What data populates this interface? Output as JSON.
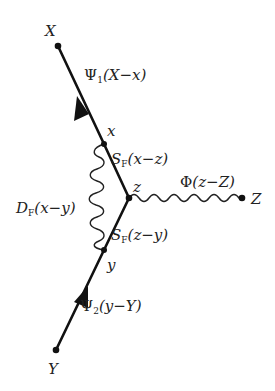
{
  "diagram": {
    "type": "feynman-diagram",
    "colors": {
      "line": "#111111",
      "text": "#222222",
      "background": "#ffffff"
    },
    "points": {
      "X": {
        "label": "X",
        "kind": "external"
      },
      "Y": {
        "label": "Y",
        "kind": "external"
      },
      "Z": {
        "label": "Z",
        "kind": "external"
      },
      "x": {
        "label": "x",
        "kind": "vertex"
      },
      "y": {
        "label": "y",
        "kind": "vertex"
      },
      "z": {
        "label": "z",
        "kind": "vertex"
      }
    },
    "lines": {
      "psi1": {
        "symbol": "Ψ",
        "sub": "1",
        "arg": "(X−x)",
        "style": "fermion-arrow",
        "from": "x",
        "to": "X"
      },
      "sf_xz": {
        "symbol": "S",
        "sub": "F",
        "arg": "(x−z)",
        "style": "fermion",
        "from": "z",
        "to": "x"
      },
      "sf_zy": {
        "symbol": "S",
        "sub": "F",
        "arg": "(z−y)",
        "style": "fermion",
        "from": "y",
        "to": "z"
      },
      "psi2": {
        "symbol": "Ψ",
        "sub": "2",
        "arg": "(y−Y)",
        "style": "fermion-arrow",
        "from": "Y",
        "to": "y"
      },
      "df": {
        "symbol": "D",
        "sub": "F",
        "arg": "(x−y)",
        "style": "photon-wavy",
        "from": "x",
        "to": "y"
      },
      "phi": {
        "symbol": "Φ",
        "sub": "",
        "arg": "(z−Z)",
        "style": "boson-wavy",
        "from": "z",
        "to": "Z"
      }
    }
  }
}
